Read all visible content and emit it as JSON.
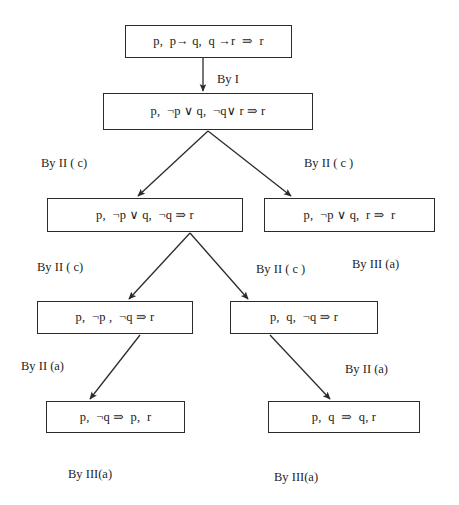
{
  "diagram": {
    "stroke_color": "#2b2b2b",
    "text_color": "#1a1a1a",
    "background_color": "#ffffff",
    "nodes": [
      {
        "id": "n1",
        "text": "p,  p→ q,  q →r  ⇒  r",
        "x": 125,
        "y": 25,
        "w": 167,
        "h": 33
      },
      {
        "id": "n2",
        "text": "p,  ¬p ∨ q,  ¬q∨ r ⇒ r",
        "x": 103,
        "y": 93,
        "w": 210,
        "h": 37
      },
      {
        "id": "n3",
        "text": "p,  ¬p ∨ q,  ¬q ⇒ r",
        "x": 47,
        "y": 198,
        "w": 196,
        "h": 34
      },
      {
        "id": "n4",
        "text": "p,  ¬p ∨ q,  r ⇒  r",
        "x": 264,
        "y": 198,
        "w": 171,
        "h": 34
      },
      {
        "id": "n5",
        "text": "p,  ¬p ,  ¬q ⇒ r",
        "x": 37,
        "y": 301,
        "w": 156,
        "h": 33
      },
      {
        "id": "n6",
        "text": "p,  q,  ¬q ⇒ r",
        "x": 230,
        "y": 301,
        "w": 148,
        "h": 33
      },
      {
        "id": "n7",
        "text": "p,  ¬q ⇒  p,  r",
        "x": 46,
        "y": 401,
        "w": 139,
        "h": 32
      },
      {
        "id": "n8",
        "text": "p,  q  ⇒  q, r",
        "x": 268,
        "y": 401,
        "w": 152,
        "h": 32
      }
    ],
    "labels": [
      {
        "id": "l-by-i",
        "text": "By I",
        "x": 217,
        "y": 73
      },
      {
        "id": "l-by-ii-c-1",
        "text": "By II ( c)",
        "x": 41,
        "y": 157
      },
      {
        "id": "l-by-ii-c-2",
        "text": "By II ( c )",
        "x": 304,
        "y": 157
      },
      {
        "id": "l-by-ii-c-3",
        "text": "By II ( c)",
        "x": 37,
        "y": 261
      },
      {
        "id": "l-by-ii-c-4",
        "text": "By II ( c )",
        "x": 256,
        "y": 263
      },
      {
        "id": "l-by-iii-a-1",
        "text": "By III (a)",
        "x": 352,
        "y": 258
      },
      {
        "id": "l-by-ii-a-1",
        "text": "By II (a)",
        "x": 21,
        "y": 360
      },
      {
        "id": "l-by-ii-a-2",
        "text": "By II (a)",
        "x": 345,
        "y": 363
      },
      {
        "id": "l-by-iii-a-2",
        "text": "By III(a)",
        "x": 68,
        "y": 468
      },
      {
        "id": "l-by-iii-a-3",
        "text": "By III(a)",
        "x": 274,
        "y": 471
      }
    ],
    "edges": [
      {
        "id": "e1",
        "from": "n1",
        "to": "n2",
        "x1": 203,
        "y1": 58,
        "x2": 203,
        "y2": 91,
        "arrow": true
      },
      {
        "id": "e2",
        "from": "n2",
        "to": "n3",
        "x1": 208,
        "y1": 131,
        "x2": 138,
        "y2": 196,
        "arrow": true
      },
      {
        "id": "e3",
        "from": "n2",
        "to": "n4",
        "x1": 208,
        "y1": 131,
        "x2": 291,
        "y2": 196,
        "arrow": true
      },
      {
        "id": "e4",
        "from": "n3",
        "to": "n5",
        "x1": 190,
        "y1": 233,
        "x2": 129,
        "y2": 299,
        "arrow": true
      },
      {
        "id": "e5",
        "from": "n3",
        "to": "n6",
        "x1": 190,
        "y1": 233,
        "x2": 248,
        "y2": 299,
        "arrow": true
      },
      {
        "id": "e6",
        "from": "n5",
        "to": "n7",
        "x1": 140,
        "y1": 335,
        "x2": 90,
        "y2": 399,
        "arrow": true
      },
      {
        "id": "e7",
        "from": "n6",
        "to": "n8",
        "x1": 270,
        "y1": 335,
        "x2": 330,
        "y2": 399,
        "arrow": true
      }
    ]
  }
}
